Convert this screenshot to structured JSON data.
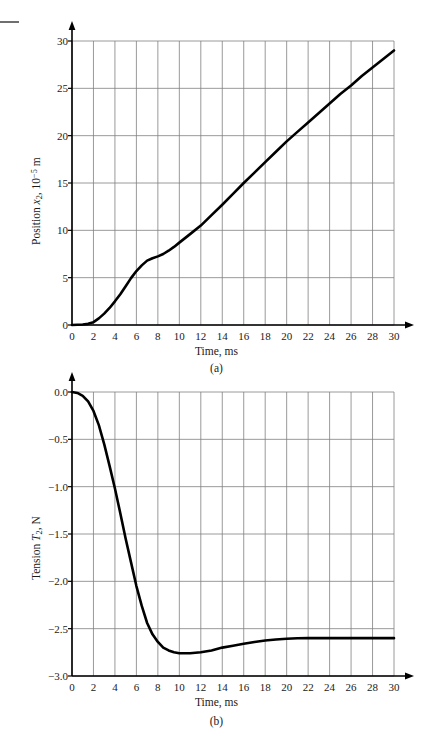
{
  "figures": [
    {
      "id": "a",
      "caption": "(a)",
      "xlabel": "Time, ms",
      "ylabel_html": "Position <i>x</i><sub>2</sub>, 10<sup>−5</sup> m",
      "ylabel_text": "Position x2, 10^-5 m",
      "xticks": [
        "0",
        "2",
        "4",
        "6",
        "8",
        "10",
        "12",
        "14",
        "16",
        "18",
        "20",
        "22",
        "24",
        "26",
        "28",
        "30"
      ],
      "yticks": [
        "0",
        "5",
        "10",
        "15",
        "20",
        "25",
        "30"
      ]
    },
    {
      "id": "b",
      "caption": "(b)",
      "xlabel": "Time, ms",
      "ylabel_html": "Tension <i>T</i><sub>2</sub>, N",
      "ylabel_text": "Tension T2, N",
      "xticks": [
        "0",
        "2",
        "4",
        "6",
        "8",
        "10",
        "12",
        "14",
        "16",
        "18",
        "20",
        "22",
        "24",
        "26",
        "28",
        "30"
      ],
      "yticks": [
        "0.0",
        "−0.5",
        "−1.0",
        "−1.5",
        "−2.0",
        "−2.5",
        "−3.0"
      ]
    }
  ],
  "colors": {
    "curve": "#000000",
    "grid": "#808080",
    "axis": "#000000",
    "text": "#1a1a1a",
    "background": "#ffffff"
  },
  "chart_data": [
    {
      "type": "line",
      "id": "a",
      "title": "(a)",
      "xlabel": "Time, ms",
      "ylabel": "Position x2, 10^-5 m",
      "xlim": [
        0,
        30
      ],
      "ylim": [
        0,
        30
      ],
      "xticks": [
        0,
        2,
        4,
        6,
        8,
        10,
        12,
        14,
        16,
        18,
        20,
        22,
        24,
        26,
        28,
        30
      ],
      "yticks": [
        0,
        5,
        10,
        15,
        20,
        25,
        30
      ],
      "grid": true,
      "legend": "none",
      "x": [
        0,
        0.5,
        1,
        1.5,
        2,
        2.5,
        3,
        3.5,
        4,
        4.5,
        5,
        5.5,
        6,
        6.5,
        7,
        7.5,
        8,
        8.5,
        9,
        9.5,
        10,
        11,
        12,
        13,
        14,
        15,
        16,
        17,
        18,
        19,
        20,
        21,
        22,
        23,
        24,
        25,
        26,
        27,
        28,
        29,
        30
      ],
      "y": [
        0,
        0.02,
        0.05,
        0.12,
        0.3,
        0.7,
        1.2,
        1.8,
        2.5,
        3.25,
        4.1,
        4.95,
        5.7,
        6.3,
        6.8,
        7.05,
        7.25,
        7.5,
        7.85,
        8.25,
        8.7,
        9.6,
        10.5,
        11.6,
        12.7,
        13.85,
        15.0,
        16.1,
        17.2,
        18.3,
        19.4,
        20.4,
        21.4,
        22.4,
        23.4,
        24.4,
        25.3,
        26.3,
        27.2,
        28.1,
        29.0
      ]
    },
    {
      "type": "line",
      "id": "b",
      "title": "(b)",
      "xlabel": "Time, ms",
      "ylabel": "Tension T2, N",
      "xlim": [
        0,
        30
      ],
      "ylim": [
        -3.0,
        0.0
      ],
      "xticks": [
        0,
        2,
        4,
        6,
        8,
        10,
        12,
        14,
        16,
        18,
        20,
        22,
        24,
        26,
        28,
        30
      ],
      "yticks": [
        0.0,
        -0.5,
        -1.0,
        -1.5,
        -2.0,
        -2.5,
        -3.0
      ],
      "grid": true,
      "legend": "none",
      "x": [
        0,
        0.5,
        1,
        1.5,
        2,
        2.5,
        3,
        3.5,
        4,
        4.5,
        5,
        5.5,
        6,
        6.5,
        7,
        7.5,
        8,
        8.5,
        9,
        9.5,
        10,
        10.5,
        11,
        11.5,
        12,
        13,
        14,
        15,
        16,
        17,
        18,
        19,
        20,
        21,
        22,
        23,
        24,
        26,
        28,
        30
      ],
      "y": [
        0,
        -0.01,
        -0.04,
        -0.1,
        -0.2,
        -0.35,
        -0.55,
        -0.78,
        -1.02,
        -1.28,
        -1.55,
        -1.8,
        -2.05,
        -2.26,
        -2.44,
        -2.56,
        -2.64,
        -2.7,
        -2.73,
        -2.75,
        -2.76,
        -2.76,
        -2.76,
        -2.755,
        -2.75,
        -2.73,
        -2.7,
        -2.68,
        -2.66,
        -2.64,
        -2.625,
        -2.615,
        -2.607,
        -2.602,
        -2.6,
        -2.6,
        -2.6,
        -2.6,
        -2.6,
        -2.6
      ]
    }
  ]
}
